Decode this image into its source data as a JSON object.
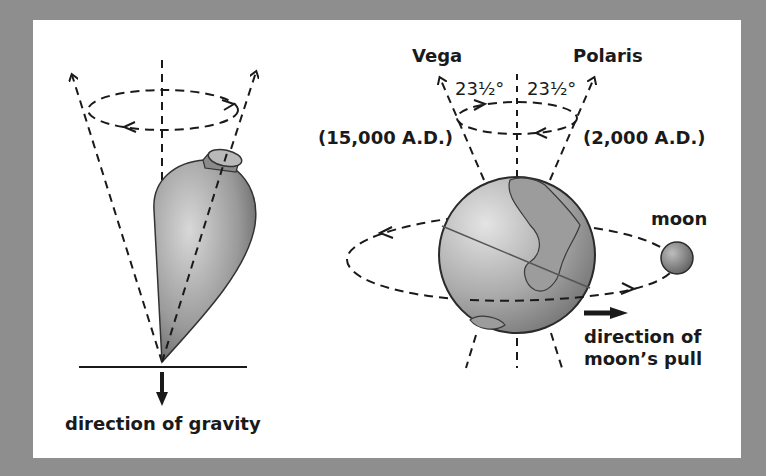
{
  "diagram": {
    "colors": {
      "background": "#8e8e8e",
      "panel": "#ffffff",
      "ink": "#1a1a1a",
      "body_fill": "#9a9a9a"
    },
    "top": {
      "gravity_label": "direction of gravity"
    },
    "earth": {
      "star_left": "Vega",
      "star_right": "Polaris",
      "angle_left": "23½°",
      "angle_right": "23½°",
      "date_left": "(15,000 A.D.)",
      "date_right": "(2,000 A.D.)",
      "moon_label": "moon",
      "pull_label_line1": "direction of",
      "pull_label_line2": "moon’s pull"
    }
  }
}
